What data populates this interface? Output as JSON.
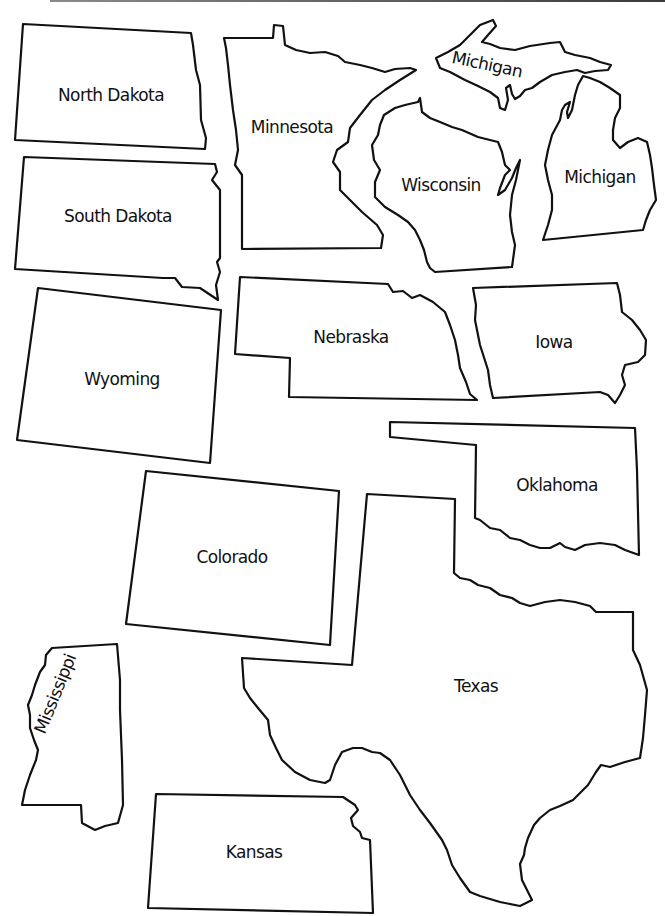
{
  "page": {
    "title": "",
    "background": "#ffffff",
    "stroke_color": "#111111"
  },
  "states": [
    {
      "id": "north-dakota",
      "label": "North Dakota"
    },
    {
      "id": "south-dakota",
      "label": "South Dakota"
    },
    {
      "id": "wyoming",
      "label": "Wyoming"
    },
    {
      "id": "minnesota",
      "label": "Minnesota"
    },
    {
      "id": "michigan-upper",
      "label": "Michigan"
    },
    {
      "id": "wisconsin",
      "label": "Wisconsin"
    },
    {
      "id": "michigan-lower",
      "label": "Michigan"
    },
    {
      "id": "nebraska",
      "label": "Nebraska"
    },
    {
      "id": "iowa",
      "label": "Iowa"
    },
    {
      "id": "oklahoma",
      "label": "Oklahoma"
    },
    {
      "id": "colorado",
      "label": "Colorado"
    },
    {
      "id": "texas",
      "label": "Texas"
    },
    {
      "id": "mississippi",
      "label": "Mississippi"
    },
    {
      "id": "kansas",
      "label": "Kansas"
    }
  ]
}
